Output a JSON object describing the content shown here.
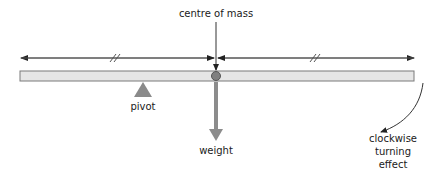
{
  "labels": {
    "centre_of_mass": "centre of mass",
    "pivot": "pivot",
    "weight": "weight",
    "turning_effect": [
      "clockwise",
      "turning",
      "effect"
    ]
  },
  "markers": {
    "equal_length_mark": "//"
  },
  "colors": {
    "beam_fill": "#e6e6e6",
    "beam_stroke": "#7a7a7a",
    "pivot_fill": "#8a8a8a",
    "weight_arrow": "#8c8c8c",
    "centre_dot": "#808080",
    "line": "#333333"
  }
}
